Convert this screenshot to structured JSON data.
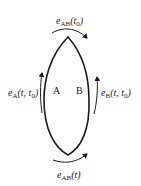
{
  "diagram": {
    "type": "closed-loop lens diagram",
    "nodes": [
      {
        "id": "A",
        "label": "A"
      },
      {
        "id": "B",
        "label": "B"
      }
    ],
    "labels": {
      "top": {
        "sym": "e",
        "sub": "AB",
        "arg": "(t",
        "arg_sub": "0",
        "close": ")"
      },
      "bottom": {
        "sym": "e",
        "sub": "AB",
        "arg": "(t)"
      },
      "left": {
        "sym": "e",
        "sub": "A",
        "arg": "(t, t",
        "arg_sub": "0",
        "close": ")"
      },
      "right": {
        "sym": "e",
        "sub": "B",
        "arg": "(t, t",
        "arg_sub": "0",
        "close": ")"
      }
    },
    "arrows": [
      {
        "position": "top",
        "direction": "clockwise-right"
      },
      {
        "position": "bottom",
        "direction": "right"
      },
      {
        "position": "left",
        "direction": "up"
      },
      {
        "position": "right",
        "direction": "up"
      }
    ],
    "stroke_color": "#1a1a1a"
  }
}
